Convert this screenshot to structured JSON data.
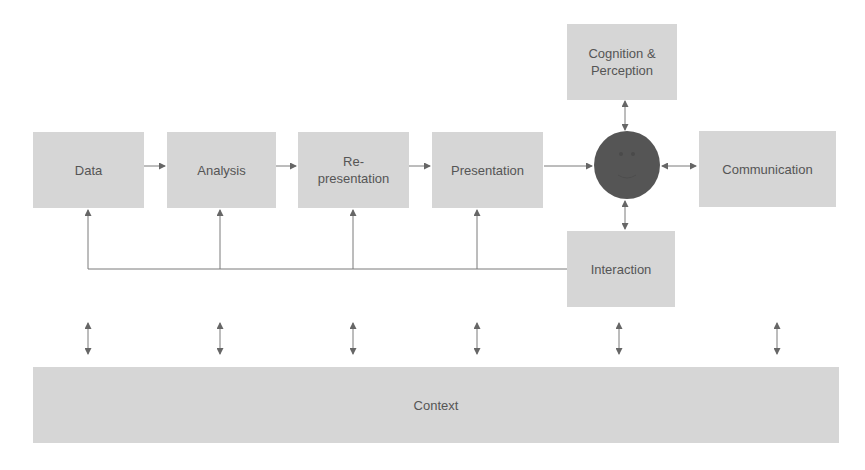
{
  "diagram": {
    "nodes": {
      "data": {
        "label": "Data"
      },
      "analysis": {
        "label": "Analysis"
      },
      "representation": {
        "line1": "Re-",
        "line2": "presentation"
      },
      "presentation": {
        "label": "Presentation"
      },
      "cognition": {
        "line1": "Cognition &",
        "line2": "Perception"
      },
      "communication": {
        "label": "Communication"
      },
      "interaction": {
        "label": "Interaction"
      },
      "context": {
        "label": "Context"
      },
      "user": {
        "icon": "smiley-face-icon"
      }
    },
    "colors": {
      "box_fill": "#d6d6d6",
      "text": "#555555",
      "line": "#777777",
      "user_circle": "#555555"
    }
  }
}
